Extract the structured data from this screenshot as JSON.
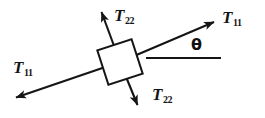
{
  "figure": {
    "name": "stress-element-diagram",
    "background_color": "#ffffff",
    "stroke_color": "#151515",
    "labels": {
      "t22_top": {
        "symbol": "T",
        "subscript": "22"
      },
      "t11_right": {
        "symbol": "T",
        "subscript": "11"
      },
      "t11_left": {
        "symbol": "T",
        "subscript": "11"
      },
      "t22_bottom": {
        "symbol": "T",
        "subscript": "22"
      },
      "theta": {
        "symbol": "θ"
      }
    },
    "geometry": {
      "element_center": {
        "x": 120,
        "y": 62
      },
      "element_half_size": 18,
      "element_rotation_deg": -18,
      "axis_t11_angle_deg": -23,
      "axis_t22_angle_deg": 67,
      "reference_line": {
        "x1": 146,
        "y1": 58,
        "x2": 221,
        "y2": 58
      },
      "arrow_tips": {
        "t11_upper_right": {
          "x": 217,
          "y": 20
        },
        "t11_lower_left": {
          "x": 12,
          "y": 100
        },
        "t22_upper_left": {
          "x": 100,
          "y": 8
        },
        "t22_lower_right": {
          "x": 139,
          "y": 109
        }
      }
    }
  }
}
